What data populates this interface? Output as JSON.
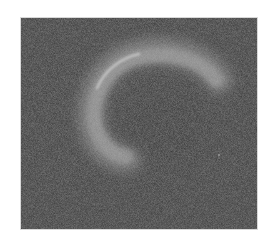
{
  "image": {
    "description": "Grayscale noisy image showing a faint bright crescent-shaped arc",
    "colors": {
      "page_background": "#ffffff",
      "panel_background": "#3b3b3b",
      "arc_glow": "#8a8a8a",
      "arc_highlight": "#c4c4c4"
    }
  }
}
